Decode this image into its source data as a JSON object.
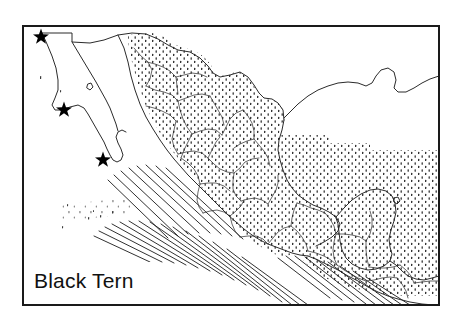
{
  "figure": {
    "type": "species-distribution-map",
    "region": "Mexico and Central America",
    "caption_label": "Black Tern",
    "frame": {
      "x": 22,
      "y": 25,
      "width": 418,
      "height": 281,
      "stroke_color": "#1a1a1a",
      "stroke_width": 2,
      "fill_color": "#ffffff"
    }
  },
  "legend": {
    "species_name": "Black Tern",
    "symbols": [
      {
        "name": "stipple-fill",
        "meaning": "winter / nonbreeding range",
        "pattern": "dots",
        "color": "#1a1a1a"
      },
      {
        "name": "star-marker",
        "meaning": "breeding or nesting locality record",
        "glyph": "star",
        "count": 3,
        "color": "#000000"
      },
      {
        "name": "diagonal-hatching",
        "meaning": "offshore / pelagic occurrence band",
        "color": "#1a1a1a"
      }
    ]
  },
  "markers": {
    "stars": [
      {
        "label": "star-baja-norte",
        "x": 41,
        "y": 36
      },
      {
        "label": "star-baja-media",
        "x": 64,
        "y": 109
      },
      {
        "label": "star-baja-sur",
        "x": 103,
        "y": 159
      }
    ]
  },
  "map_layers": {
    "coastline": {
      "name": "coastline",
      "stroke": "#2b2b2b",
      "stroke_width": 0.9
    },
    "state_boundaries": {
      "name": "state-boundaries",
      "stroke": "#2b2b2b",
      "stroke_width": 0.7
    },
    "stipple": {
      "name": "range-stipple",
      "color": "#1a1a1a",
      "dot_spacing": 7
    },
    "hatching": {
      "name": "coastal-hatching",
      "stroke": "#1a1a1a",
      "stroke_width": 0.9
    }
  },
  "colors": {
    "ink": "#1a1a1a",
    "line": "#2b2b2b",
    "paper": "#ffffff"
  }
}
